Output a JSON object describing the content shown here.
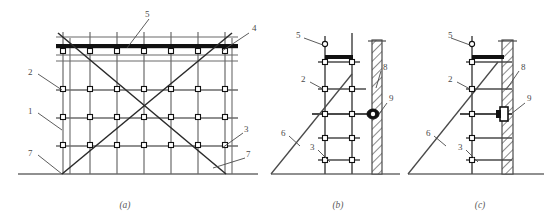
{
  "figure": {
    "background_color": "#ffffff",
    "line_color": "#6b6b6b",
    "heavy_line_color": "#111111",
    "label_color": "#4a4a4a",
    "width": 554,
    "height": 223
  },
  "panels": [
    {
      "id": "a",
      "caption": "(a)",
      "name": "scaffold-elevation-panel",
      "description": "Front elevation of double-row scaffold bay with cross bracing",
      "callouts": [
        {
          "number": "1",
          "x": 31,
          "y": 111,
          "name": "callout-1"
        },
        {
          "number": "2",
          "x": 31,
          "y": 72,
          "name": "callout-2"
        },
        {
          "number": "3",
          "x": 245,
          "y": 131,
          "name": "callout-3"
        },
        {
          "number": "4",
          "x": 253,
          "y": 29,
          "name": "callout-4"
        },
        {
          "number": "5",
          "x": 143,
          "y": 15,
          "name": "callout-5"
        },
        {
          "number": "7",
          "x": 31,
          "y": 153,
          "name": "callout-7-left"
        },
        {
          "number": "7",
          "x": 247,
          "y": 156,
          "name": "callout-7-right"
        }
      ]
    },
    {
      "id": "b",
      "caption": "(b)",
      "name": "wall-tie-detail-panel-b",
      "description": "Side view: double-post scaffold tied to wall with rigid connector",
      "callouts": [
        {
          "number": "5",
          "x": 297,
          "y": 36,
          "name": "callout-5"
        },
        {
          "number": "2",
          "x": 303,
          "y": 80,
          "name": "callout-2"
        },
        {
          "number": "3",
          "x": 310,
          "y": 148,
          "name": "callout-3"
        },
        {
          "number": "6",
          "x": 282,
          "y": 133,
          "name": "callout-6"
        },
        {
          "number": "8",
          "x": 384,
          "y": 69,
          "name": "callout-8"
        },
        {
          "number": "9",
          "x": 390,
          "y": 100,
          "name": "callout-9"
        }
      ]
    },
    {
      "id": "c",
      "caption": "(c)",
      "name": "wall-tie-detail-panel-c",
      "description": "Side view: single-post scaffold bearing directly on wall",
      "callouts": [
        {
          "number": "5",
          "x": 449,
          "y": 36,
          "name": "callout-5"
        },
        {
          "number": "2",
          "x": 450,
          "y": 80,
          "name": "callout-2"
        },
        {
          "number": "3",
          "x": 458,
          "y": 148,
          "name": "callout-3"
        },
        {
          "number": "6",
          "x": 427,
          "y": 133,
          "name": "callout-6"
        },
        {
          "number": "8",
          "x": 522,
          "y": 69,
          "name": "callout-8"
        },
        {
          "number": "9",
          "x": 528,
          "y": 100,
          "name": "callout-9"
        }
      ]
    }
  ],
  "captions": {
    "a": "(a)",
    "b": "(b)",
    "c": "(c)"
  },
  "legend_numbers": [
    "1",
    "2",
    "3",
    "4",
    "5",
    "6",
    "7",
    "8",
    "9"
  ]
}
